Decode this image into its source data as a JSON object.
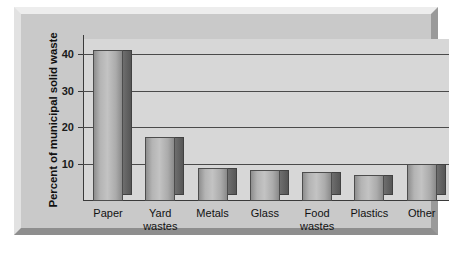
{
  "chart_data": {
    "type": "bar",
    "title": "",
    "xlabel": "",
    "ylabel": "Percent of municipal solid waste",
    "categories": [
      "Paper",
      "Yard\nwastes",
      "Metals",
      "Glass",
      "Food\nwastes",
      "Plastics",
      "Other"
    ],
    "values": [
      41,
      17.5,
      9,
      8.5,
      8,
      7,
      10
    ],
    "ytick_labels": [
      "10",
      "20",
      "30",
      "40"
    ],
    "ytick_values": [
      10,
      20,
      30,
      40
    ],
    "ylim": [
      0,
      44
    ],
    "grid": "horizontal",
    "legend": "none",
    "colors": {
      "bar_face": "#b4b4b4",
      "bar_side": "#626262",
      "plot_background": "#d7d7d7",
      "panel_background": "#c9c9c9",
      "gridline": "#4a4a4a",
      "axis": "#3a3a3a",
      "text": "#111111"
    }
  }
}
